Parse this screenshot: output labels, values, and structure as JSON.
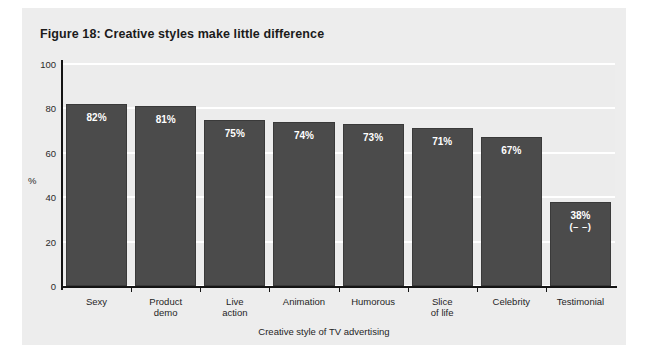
{
  "figure": {
    "title": "Figure 18: Creative styles make little difference"
  },
  "chart_data": {
    "type": "bar",
    "title": "Figure 18: Creative styles make little difference",
    "xlabel": "Creative style of TV advertising",
    "ylabel": "%",
    "ylim": [
      0,
      100
    ],
    "yticks": [
      0,
      20,
      40,
      60,
      80,
      100
    ],
    "grid": true,
    "legend": false,
    "categories": [
      "Sexy",
      "Product demo",
      "Live action",
      "Animation",
      "Humorous",
      "Slice of life",
      "Celebrity",
      "Testimonial"
    ],
    "category_lines": [
      [
        "Sexy"
      ],
      [
        "Product",
        "demo"
      ],
      [
        "Live",
        "action"
      ],
      [
        "Animation"
      ],
      [
        "Humorous"
      ],
      [
        "Slice",
        "of life"
      ],
      [
        "Celebrity"
      ],
      [
        "Testimonial"
      ]
    ],
    "values": [
      82,
      81,
      75,
      74,
      73,
      71,
      67,
      38
    ],
    "value_labels": [
      "82%",
      "81%",
      "75%",
      "74%",
      "73%",
      "71%",
      "67%",
      "38%"
    ],
    "annotations": [
      "",
      "",
      "",
      "",
      "",
      "",
      "",
      "(– –)"
    ],
    "bar_color": "#4b4b4b",
    "plot_background": "#ececec",
    "gridline_color": "#ffffff",
    "value_label_color": "#ffffff"
  }
}
